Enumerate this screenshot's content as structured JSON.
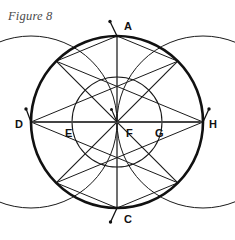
{
  "figure": {
    "caption": "Figure 8",
    "type": "geometric-construction",
    "background_color": "#ffffff",
    "ink_color": "#1a1a1a",
    "caption_color": "#4a4a4a"
  },
  "geometry": {
    "center": {
      "x": 117,
      "y": 122,
      "label": "F"
    },
    "outer_circle": {
      "cx": 117,
      "cy": 122,
      "r": 86,
      "stroke_width": 2.6
    },
    "inner_circle": {
      "cx": 117,
      "cy": 122,
      "r": 45,
      "stroke_width": 1.0
    },
    "arc_left": {
      "cx": 31,
      "cy": 122,
      "r": 86,
      "stroke_width": 1.0,
      "note": "vesica arc centered at D through A and C"
    },
    "arc_right": {
      "cx": 203,
      "cy": 122,
      "r": 86,
      "stroke_width": 1.0,
      "note": "vesica arc centered at H through A and C"
    },
    "diameter_horizontal": {
      "x1": 31,
      "y1": 122,
      "x2": 203,
      "y2": 122,
      "stroke_width": 1.8
    },
    "diameter_vertical": {
      "x1": 117,
      "y1": 36,
      "x2": 117,
      "y2": 208,
      "stroke_width": 1.2
    },
    "diagonal_nw_se": {
      "x1": 56.2,
      "y1": 61.2,
      "x2": 177.8,
      "y2": 182.8,
      "stroke_width": 1.2
    },
    "diagonal_ne_sw": {
      "x1": 177.8,
      "y1": 61.2,
      "x2": 56.2,
      "y2": 182.8,
      "stroke_width": 1.2
    },
    "chords": [
      {
        "name": "D-to-NE",
        "x1": 31,
        "y1": 122,
        "x2": 177.8,
        "y2": 61.2
      },
      {
        "name": "D-to-SE",
        "x1": 31,
        "y1": 122,
        "x2": 177.8,
        "y2": 182.8
      },
      {
        "name": "H-to-NW",
        "x1": 203,
        "y1": 122,
        "x2": 56.2,
        "y2": 61.2
      },
      {
        "name": "H-to-SW",
        "x1": 203,
        "y1": 122,
        "x2": 56.2,
        "y2": 182.8
      },
      {
        "name": "A-to-NW",
        "x1": 117,
        "y1": 36,
        "x2": 56.2,
        "y2": 61.2
      },
      {
        "name": "A-to-NE",
        "x1": 117,
        "y1": 36,
        "x2": 177.8,
        "y2": 61.2
      },
      {
        "name": "C-to-SW",
        "x1": 117,
        "y1": 208,
        "x2": 56.2,
        "y2": 182.8
      },
      {
        "name": "C-to-SE",
        "x1": 117,
        "y1": 208,
        "x2": 177.8,
        "y2": 182.8
      }
    ],
    "compass_ticks": [
      {
        "name": "tick-at-A",
        "x1": 117,
        "y1": 36,
        "x2": 110.5,
        "y2": 22.5,
        "dot_x": 110.0,
        "dot_y": 21.5
      },
      {
        "name": "tick-at-D",
        "x1": 31,
        "y1": 122,
        "x2": 26.5,
        "y2": 110.0,
        "dot_x": 26.0,
        "dot_y": 109.0
      },
      {
        "name": "tick-at-H",
        "x1": 203,
        "y1": 122,
        "x2": 208.5,
        "y2": 110.0,
        "dot_x": 209.0,
        "dot_y": 109.0
      },
      {
        "name": "tick-at-C",
        "x1": 117,
        "y1": 208,
        "x2": 111.0,
        "y2": 221.0,
        "dot_x": 110.5,
        "dot_y": 222.0
      },
      {
        "name": "tick-at-F",
        "x1": 117,
        "y1": 122,
        "x2": 112.0,
        "y2": 110.5,
        "dot_x": 111.5,
        "dot_y": 109.5
      }
    ],
    "points": [
      {
        "id": "A",
        "label": "A",
        "x": 117,
        "y": 36,
        "label_x": 124,
        "label_y": 30,
        "position": "top"
      },
      {
        "id": "C",
        "label": "C",
        "x": 117,
        "y": 208,
        "label_x": 124,
        "label_y": 223,
        "position": "bottom"
      },
      {
        "id": "D",
        "label": "D",
        "x": 31,
        "y": 122,
        "label_x": 16,
        "label_y": 128,
        "position": "left"
      },
      {
        "id": "H",
        "label": "H",
        "x": 203,
        "y": 122,
        "label_x": 209,
        "label_y": 128,
        "position": "right"
      },
      {
        "id": "E",
        "label": "E",
        "x": 72,
        "y": 122,
        "label_x": 66,
        "label_y": 137,
        "position": "inner-left"
      },
      {
        "id": "F",
        "label": "F",
        "x": 117,
        "y": 122,
        "label_x": 126,
        "label_y": 137,
        "position": "center"
      },
      {
        "id": "G",
        "label": "G",
        "x": 162,
        "y": 122,
        "label_x": 156,
        "label_y": 137,
        "position": "inner-right"
      }
    ]
  }
}
